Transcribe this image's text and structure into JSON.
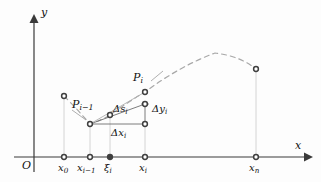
{
  "figure": {
    "type": "diagram",
    "width": 321,
    "height": 182,
    "background_color": "#fdfdfd",
    "axis_color": "#3a3a3a",
    "curve_color": "#9a9a9a",
    "guide_color": "#c9c9c9",
    "point_color": "#4a4a4a",
    "text_color": "#111111"
  },
  "axes": {
    "origin_label": "O",
    "x_axis_label": "x",
    "y_axis_label": "y",
    "x_axis_y_px": 157,
    "y_axis_x_px": 34,
    "x_axis_end_px": 310,
    "y_axis_top_px": 16
  },
  "ticks": [
    {
      "name": "x0",
      "base": "x",
      "sub": "0",
      "x_px": 64,
      "label_x_px": 58,
      "label_y_px": 164
    },
    {
      "name": "xi-1",
      "base": "x",
      "sub": "i−1",
      "x_px": 90,
      "label_x_px": 79,
      "label_y_px": 164
    },
    {
      "name": "xii",
      "base": "ξ",
      "sub": "i",
      "x_px": 110,
      "label_x_px": 104,
      "label_y_px": 164
    },
    {
      "name": "xi",
      "base": "x",
      "sub": "i",
      "x_px": 145,
      "label_x_px": 139,
      "label_y_px": 164
    },
    {
      "name": "xn",
      "base": "x",
      "sub": "n",
      "x_px": 256,
      "label_x_px": 250,
      "label_y_px": 164
    }
  ],
  "points": [
    {
      "name": "point-x0-curve",
      "x_px": 64,
      "y_px": 96,
      "filled": true
    },
    {
      "name": "point-Pi-1",
      "x_px": 90,
      "y_px": 124,
      "filled": true
    },
    {
      "name": "point-xi-curve",
      "x_px": 110,
      "y_px": 115,
      "filled": true
    },
    {
      "name": "point-Pi",
      "x_px": 145,
      "y_px": 92,
      "filled": true
    },
    {
      "name": "point-corner-top",
      "x_px": 145,
      "y_px": 104,
      "filled": true
    },
    {
      "name": "point-corner-base",
      "x_px": 145,
      "y_px": 124,
      "filled": true
    },
    {
      "name": "point-xn-curve",
      "x_px": 256,
      "y_px": 69,
      "filled": true
    }
  ],
  "labels": {
    "p_prev": {
      "base": "P",
      "sub": "i−1",
      "x_px": 74,
      "y_px": 104
    },
    "p_curr": {
      "base": "P",
      "sub": "i",
      "x_px": 134,
      "y_px": 77
    },
    "delta_s": {
      "base": "Δs",
      "sub": "i",
      "x_px": 114,
      "y_px": 108
    },
    "delta_y": {
      "base": "Δy",
      "sub": "i",
      "x_px": 152,
      "y_px": 108
    },
    "delta_x": {
      "base": "Δx",
      "sub": "i",
      "x_px": 112,
      "y_px": 131
    }
  },
  "segments": {
    "delta_x_line": {
      "from_x": 90,
      "from_y": 124,
      "to_x": 145,
      "to_y": 124
    },
    "delta_y_line": {
      "from_x": 145,
      "from_y": 104,
      "to_x": 145,
      "to_y": 124
    },
    "delta_s_line": {
      "from_x": 90,
      "from_y": 124,
      "to_x": 145,
      "to_y": 104
    },
    "chord_line": {
      "from_x": 90,
      "from_y": 124,
      "to_x": 145,
      "to_y": 92
    },
    "tangent_line": {
      "from_x": 90,
      "from_y": 124,
      "to_x": 145,
      "to_y": 92
    }
  },
  "curve": {
    "style": "dashed",
    "description": "concave-down arc through the marked points",
    "path": "M 64 96 Q 78 110 90 124 Q 104 119 110 115 Q 128 102 145 92 Q 180 66 215 53 Q 240 56 256 69"
  },
  "leader_lines": [
    {
      "name": "leader-Pi-1",
      "from_x": 72,
      "from_y": 112,
      "to_x": 85,
      "to_y": 120
    },
    {
      "name": "leader-Pi",
      "from_x": 150,
      "from_y": 80,
      "to_x": 162,
      "to_y": 72
    }
  ]
}
